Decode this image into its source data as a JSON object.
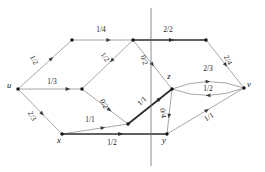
{
  "figure": {
    "type": "flow-network-diagram",
    "title": "",
    "width": 265,
    "height": 172,
    "background": "#ffffff",
    "edge_color": "#8a8a8a",
    "highlight_color": "#2b2b2b",
    "cutline_color": "#6e6e6e",
    "label_color": "#1a1a1a"
  },
  "nodes": [
    {
      "id": "u",
      "label": "u",
      "x": 18,
      "y": 89,
      "label_dx": -9,
      "label_dy": -4,
      "show_label": true
    },
    {
      "id": "a",
      "label": "",
      "x": 72,
      "y": 40,
      "label_dx": 0,
      "label_dy": 0,
      "show_label": false
    },
    {
      "id": "b",
      "label": "",
      "x": 133,
      "y": 40,
      "label_dx": 0,
      "label_dy": 0,
      "show_label": false
    },
    {
      "id": "c",
      "label": "",
      "x": 206,
      "y": 40,
      "label_dx": 0,
      "label_dy": 0,
      "show_label": false
    },
    {
      "id": "v",
      "label": "v",
      "x": 244,
      "y": 88,
      "label_dx": 5,
      "label_dy": -4,
      "show_label": true
    },
    {
      "id": "z",
      "label": "z",
      "x": 172,
      "y": 89,
      "label_dx": -3,
      "label_dy": -13,
      "show_label": true
    },
    {
      "id": "m",
      "label": "",
      "x": 82,
      "y": 89,
      "label_dx": 0,
      "label_dy": 0,
      "show_label": false
    },
    {
      "id": "n",
      "label": "",
      "x": 128,
      "y": 124,
      "label_dx": 0,
      "label_dy": 0,
      "show_label": false
    },
    {
      "id": "x",
      "label": "x",
      "x": 62,
      "y": 134,
      "label_dx": -3,
      "label_dy": 6,
      "show_label": true
    },
    {
      "id": "y",
      "label": "y",
      "x": 167,
      "y": 134,
      "label_dx": -3,
      "label_dy": 6,
      "show_label": true
    }
  ],
  "edges": [
    {
      "id": "u-a",
      "from": "u",
      "to": "a",
      "label": "1/2",
      "flow": 1,
      "capacity": 2,
      "highlight": false,
      "curve": 0,
      "label_x": 34,
      "label_y": 60,
      "rot": 62,
      "arrow_t": 0.62
    },
    {
      "id": "a-b",
      "from": "a",
      "to": "b",
      "label": "1/4",
      "flow": 1,
      "capacity": 4,
      "highlight": false,
      "curve": 0,
      "label_x": 101,
      "label_y": 30,
      "rot": 0,
      "arrow_t": 0.6
    },
    {
      "id": "b-c",
      "from": "b",
      "to": "c",
      "label": "2/2",
      "flow": 2,
      "capacity": 2,
      "highlight": true,
      "curve": 0,
      "label_x": 168,
      "label_y": 30,
      "rot": 0,
      "arrow_t": 0.53
    },
    {
      "id": "c-v",
      "from": "c",
      "to": "v",
      "label": "2/4",
      "flow": 2,
      "capacity": 4,
      "highlight": false,
      "curve": 0,
      "label_x": 228,
      "label_y": 60,
      "rot": 62,
      "arrow_t": 0.52
    },
    {
      "id": "b-m",
      "from": "b",
      "to": "m",
      "label": "1/2",
      "flow": 1,
      "capacity": 2,
      "highlight": false,
      "curve": 0,
      "label_x": 105,
      "label_y": 57,
      "rot": 55,
      "arrow_t": 0.42
    },
    {
      "id": "u-m",
      "from": "u",
      "to": "m",
      "label": "1/3",
      "flow": 1,
      "capacity": 3,
      "highlight": false,
      "curve": 0,
      "label_x": 52,
      "label_y": 82,
      "rot": 0,
      "arrow_t": 0.78
    },
    {
      "id": "m-n",
      "from": "m",
      "to": "n",
      "label": "0/2",
      "flow": 0,
      "capacity": 2,
      "highlight": false,
      "curve": 0,
      "label_x": 104,
      "label_y": 104,
      "rot": 62,
      "arrow_t": 0.6
    },
    {
      "id": "b-z",
      "from": "b",
      "to": "z",
      "label": "0/2",
      "flow": 0,
      "capacity": 2,
      "highlight": false,
      "curve": 0,
      "label_x": 144,
      "label_y": 60,
      "rot": 72,
      "arrow_t": 0.5
    },
    {
      "id": "n-z",
      "from": "n",
      "to": "z",
      "label": "1/1",
      "flow": 1,
      "capacity": 1,
      "highlight": true,
      "curve": 0,
      "label_x": 142,
      "label_y": 101,
      "rot": -43,
      "arrow_t": 0.72
    },
    {
      "id": "u-x",
      "from": "u",
      "to": "x",
      "label": "2/3",
      "flow": 2,
      "capacity": 3,
      "highlight": false,
      "curve": 0,
      "label_x": 32,
      "label_y": 116,
      "rot": 62,
      "arrow_t": 0.55
    },
    {
      "id": "x-n",
      "from": "x",
      "to": "n",
      "label": "1/1",
      "flow": 1,
      "capacity": 1,
      "highlight": false,
      "curve": 0,
      "label_x": 90,
      "label_y": 120,
      "rot": 0,
      "arrow_t": 0.62
    },
    {
      "id": "x-y",
      "from": "x",
      "to": "y",
      "label": "1/2",
      "flow": 1,
      "capacity": 2,
      "highlight": true,
      "curve": 0,
      "label_x": 112,
      "label_y": 143,
      "rot": 0,
      "arrow_t": 0.56
    },
    {
      "id": "z-y",
      "from": "z",
      "to": "y",
      "label": "0/4",
      "flow": 0,
      "capacity": 4,
      "highlight": false,
      "curve": 0,
      "label_x": 163,
      "label_y": 113,
      "rot": 80,
      "arrow_t": 0.6
    },
    {
      "id": "z-v",
      "from": "z",
      "to": "v",
      "label": "2/3",
      "flow": 2,
      "capacity": 3,
      "highlight": false,
      "curve": -14,
      "label_x": 208,
      "label_y": 69,
      "rot": 0,
      "arrow_t": 0.5
    },
    {
      "id": "v-z",
      "from": "v",
      "to": "z",
      "label": "1/2",
      "flow": 1,
      "capacity": 2,
      "highlight": false,
      "curve": -14,
      "label_x": 208,
      "label_y": 89,
      "rot": 0,
      "arrow_t": 0.5
    },
    {
      "id": "y-v",
      "from": "y",
      "to": "v",
      "label": "1/1",
      "flow": 1,
      "capacity": 1,
      "highlight": false,
      "curve": 0,
      "label_x": 209,
      "label_y": 117,
      "rot": -32,
      "arrow_t": 0.52
    }
  ],
  "cutline": {
    "id": "cut-line",
    "x": 151,
    "y1": 8,
    "y2": 166
  }
}
